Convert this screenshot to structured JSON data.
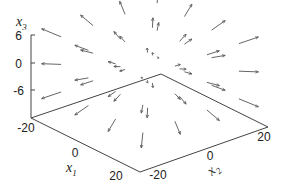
{
  "chart_data": {
    "type": "quiver3d",
    "title": "",
    "axes": {
      "x1": {
        "label": "x",
        "sub": "1",
        "range": [
          -20,
          20
        ],
        "ticks": [
          -20,
          0,
          20
        ]
      },
      "x2": {
        "label": "x",
        "sub": "2",
        "range": [
          -20,
          20
        ],
        "ticks": [
          -20,
          0,
          20
        ]
      },
      "x3": {
        "label": "x",
        "sub": "3",
        "range": [
          -12,
          6
        ],
        "ticks": [
          6,
          0,
          -6
        ]
      }
    },
    "grid": false,
    "legend": null,
    "field": {
      "description": "radial outward vector field sampled on a grid",
      "x1_samples": [
        -15,
        -5,
        5,
        15
      ],
      "x2_samples": [
        -15,
        -5,
        5,
        15
      ],
      "x3_samples": [
        -6,
        0,
        6
      ],
      "vector_scale": 0.22
    },
    "colors": {
      "axis": "#444444",
      "vector": "#555555",
      "text": "#222222"
    }
  }
}
